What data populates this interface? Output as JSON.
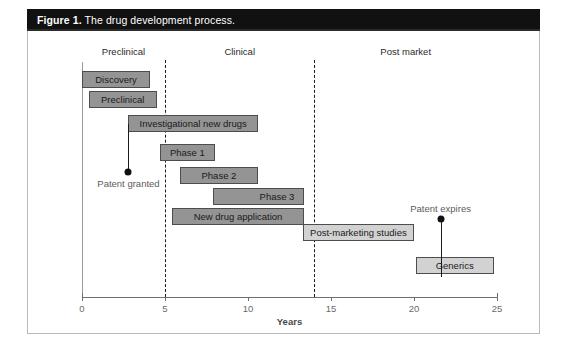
{
  "figure": {
    "label": "Figure 1.",
    "title": "The drug development process."
  },
  "chart_data": {
    "type": "bar",
    "orientation": "horizontal",
    "title": "The drug development process.",
    "xlabel": "Years",
    "ylabel": "",
    "xlim": [
      0,
      25
    ],
    "xticks": [
      0,
      5,
      10,
      15,
      20,
      25
    ],
    "xtick_labels": [
      "0",
      "5",
      "10",
      "15",
      "20",
      "25"
    ],
    "grid": false,
    "legend": "none",
    "stages": [
      {
        "label": "Preclinical",
        "center_year": 2.5
      },
      {
        "label": "Clinical",
        "center_year": 9.5
      },
      {
        "label": "Post market",
        "center_year": 19.5
      }
    ],
    "dividers": [
      {
        "year": 5,
        "style": "dashed"
      },
      {
        "year": 14,
        "style": "dashed"
      }
    ],
    "bars": [
      {
        "label": "Discovery",
        "start": 0.0,
        "end": 4.1,
        "shade": "dark",
        "align": "center"
      },
      {
        "label": "Preclinical",
        "start": 0.4,
        "end": 4.5,
        "shade": "dark",
        "align": "center"
      },
      {
        "label": "Investigational new drugs",
        "start": 2.8,
        "end": 10.6,
        "shade": "dark",
        "align": "center"
      },
      {
        "label": "Phase 1",
        "start": 4.7,
        "end": 8.0,
        "shade": "dark",
        "align": "center"
      },
      {
        "label": "Phase 2",
        "start": 5.9,
        "end": 10.6,
        "shade": "dark",
        "align": "center"
      },
      {
        "label": "Phase 3",
        "start": 7.9,
        "end": 13.4,
        "shade": "dark",
        "align": "right"
      },
      {
        "label": "New drug application",
        "start": 5.4,
        "end": 13.4,
        "shade": "dark",
        "align": "center"
      },
      {
        "label": "Post-marketing studies",
        "start": 13.3,
        "end": 20.0,
        "shade": "light",
        "align": "center"
      },
      {
        "label": "Generics",
        "start": 20.1,
        "end": 24.8,
        "shade": "light",
        "align": "center"
      }
    ],
    "annotations": [
      {
        "label": "Patent granted",
        "year": 2.8,
        "marker": "dot-below"
      },
      {
        "label": "Patent expires",
        "year": 21.6,
        "marker": "dot-above"
      }
    ]
  }
}
